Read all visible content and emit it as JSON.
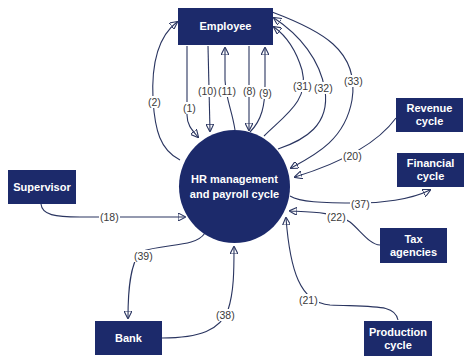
{
  "diagram": {
    "type": "context diagram",
    "center": {
      "id": "hr",
      "label_line1": "HR management",
      "label_line2": "and payroll cycle"
    },
    "entities": {
      "employee": {
        "label": "Employee"
      },
      "supervisor": {
        "label": "Supervisor"
      },
      "bank": {
        "label": "Bank"
      },
      "revenue": {
        "label_line1": "Revenue",
        "label_line2": "cycle"
      },
      "financial": {
        "label_line1": "Financial",
        "label_line2": "cycle"
      },
      "tax": {
        "label": "Tax agencies"
      },
      "production": {
        "label_line1": "Production",
        "label_line2": "cycle"
      }
    },
    "flows": [
      {
        "id": "f1",
        "label": "(1)",
        "from": "Employee",
        "to": "HR management and payroll cycle"
      },
      {
        "id": "f2",
        "label": "(2)",
        "from": "HR management and payroll cycle",
        "to": "Employee"
      },
      {
        "id": "f10",
        "label": "(10)",
        "from": "Employee",
        "to": "HR management and payroll cycle"
      },
      {
        "id": "f11",
        "label": "(11)",
        "from": "HR management and payroll cycle",
        "to": "Employee"
      },
      {
        "id": "f8",
        "label": "(8)",
        "from": "Employee",
        "to": "HR management and payroll cycle"
      },
      {
        "id": "f9",
        "label": "(9)",
        "from": "HR management and payroll cycle",
        "to": "Employee"
      },
      {
        "id": "f31",
        "label": "(31)",
        "from": "HR management and payroll cycle",
        "to": "Employee"
      },
      {
        "id": "f32",
        "label": "(32)",
        "from": "HR management and payroll cycle",
        "to": "Employee"
      },
      {
        "id": "f33",
        "label": "(33)",
        "from": "Employee",
        "to": "HR management and payroll cycle"
      },
      {
        "id": "f20",
        "label": "(20)",
        "from": "Revenue cycle",
        "to": "HR management and payroll cycle"
      },
      {
        "id": "f37",
        "label": "(37)",
        "from": "HR management and payroll cycle",
        "to": "Financial cycle"
      },
      {
        "id": "f22",
        "label": "(22)",
        "from": "Tax agencies",
        "to": "HR management and payroll cycle"
      },
      {
        "id": "f21",
        "label": "(21)",
        "from": "Production cycle",
        "to": "HR management and payroll cycle"
      },
      {
        "id": "f18",
        "label": "(18)",
        "from": "Supervisor",
        "to": "HR management and payroll cycle"
      },
      {
        "id": "f39",
        "label": "(39)",
        "from": "HR management and payroll cycle",
        "to": "Bank"
      },
      {
        "id": "f38",
        "label": "(38)",
        "from": "Bank",
        "to": "HR management and payroll cycle"
      }
    ],
    "colors": {
      "node_fill": "#1c2a6b",
      "node_text": "#ffffff",
      "line": "#2a3560",
      "label_text": "#3a3a3a",
      "background": "#ffffff"
    }
  }
}
